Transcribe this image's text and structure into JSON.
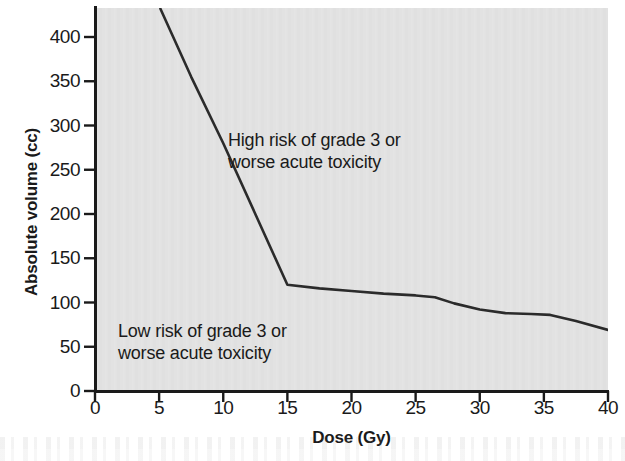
{
  "chart_data": {
    "type": "line",
    "title": "",
    "subtitle": "",
    "xlabel": "Dose (Gy)",
    "ylabel": "Absolute volume (cc)",
    "xlim": [
      0,
      40
    ],
    "ylim": [
      0,
      425
    ],
    "xticks": [
      0,
      5,
      10,
      15,
      20,
      25,
      30,
      35,
      40
    ],
    "yticks": [
      0,
      50,
      100,
      150,
      200,
      250,
      300,
      350,
      400
    ],
    "xtick_labels": [
      "0",
      "5",
      "10",
      "15",
      "20",
      "25",
      "30",
      "35",
      "40"
    ],
    "ytick_labels": [
      "0",
      "50",
      "100",
      "150",
      "200",
      "250",
      "300",
      "350",
      "400"
    ],
    "grid": false,
    "legend": "none",
    "plot_background_color": "#e2e2e2",
    "line_color": "#2b2b2b",
    "series": [
      {
        "name": "Dose-volume constraint threshold",
        "x": [
          5.1,
          7.5,
          10,
          12.5,
          15,
          17.5,
          20,
          22.5,
          25,
          26.5,
          28,
          30,
          32,
          34,
          35.5,
          37.5,
          40
        ],
        "values": [
          432,
          355,
          280,
          200,
          120,
          116,
          113,
          110,
          108,
          106,
          99,
          92,
          88,
          87,
          86,
          79,
          69
        ]
      }
    ],
    "annotations": [
      {
        "name": "high-risk-region-label",
        "text": "High risk of grade 3 or\nworse acute toxicity",
        "x": 20.8,
        "y": 290
      },
      {
        "name": "low-risk-region-label",
        "text": "Low risk of grade 3 or\nworse acute toxicity",
        "x": 3.6,
        "y": 72
      }
    ]
  },
  "figure": {
    "axis_color": "#1a1a1a",
    "text_color": "#1a1a1a",
    "page_background_color": "#ffffff"
  }
}
